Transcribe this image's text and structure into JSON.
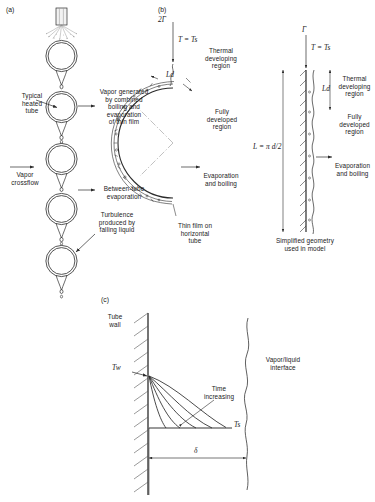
{
  "figure": {
    "type": "technical-diagram",
    "panels": [
      {
        "id": "(a)",
        "name": "tube-bundle-overview",
        "labels": [
          "Typical heated tube",
          "Vapor generated by combined boiling and evaporation of thin film",
          "Vapor crossflow",
          "Between-tube evaporation",
          "Turbulence produced by falling liquid"
        ]
      },
      {
        "id": "(b)",
        "name": "film-on-tube-and-simplified-geometry",
        "labels": [
          "Thermal developing region",
          "Fully developed region",
          "Evaporation and boiling",
          "Thin film on horizontal tube",
          "Simplified geometry used in model"
        ]
      },
      {
        "id": "(c)",
        "name": "temperature-profile-development",
        "labels": [
          "Tube wall",
          "Time increasing",
          "Vapor/liquid interface"
        ]
      }
    ]
  },
  "panel_a": {
    "id": "(a)",
    "typical_heated_tube": "Typical\nheated\ntube",
    "typical_heated_tube_lines": [
      "Typical",
      "heated",
      "tube"
    ],
    "vapor_generated_lines": [
      "Vapor generated",
      "by combined",
      "boiling and",
      "evaporation",
      "of thin film"
    ],
    "vapor_crossflow_lines": [
      "Vapor",
      "crossflow"
    ],
    "between_tube_lines": [
      "Between-tube",
      "evaporation"
    ],
    "turbulence_lines": [
      "Turbulence",
      "produced by",
      "falling liquid"
    ],
    "tube_count": 5
  },
  "panel_b": {
    "id": "(b)",
    "inlet_flow_symbol": "2Γ",
    "saturation_temp": "T = T",
    "saturation_temp_sub": "s",
    "thermal_developing_lines": [
      "Thermal",
      "developing",
      "region"
    ],
    "developing_length": "Ld",
    "developing_length_italic": "L",
    "developing_length_sub": "d",
    "fully_developed_lines": [
      "Fully",
      "developed",
      "region"
    ],
    "evaporation_boiling_lines": [
      "Evaporation",
      "and boiling"
    ],
    "thin_film_lines": [
      "Thin film on",
      "horizontal",
      "tube"
    ],
    "arc_length_label": "L = π d/2",
    "arc_length_L": "L",
    "arc_length_rest": " = π d/2",
    "right_inlet_flow_symbol": "Γ",
    "right_thermal_developing_lines": [
      "Thermal",
      "developing",
      "region"
    ],
    "right_fully_developed_lines": [
      "Fully",
      "developed",
      "region"
    ],
    "right_evaporation_boiling_lines": [
      "Evaporation",
      "and boiling"
    ],
    "simplified_geometry_lines": [
      "Simplified geometry",
      "used in model"
    ]
  },
  "panel_c": {
    "id": "(c)",
    "tube_wall_lines": [
      "Tube",
      "wall"
    ],
    "wall_temp": "T",
    "wall_temp_sub": "w",
    "time_increasing_lines": [
      "Time",
      "increasing"
    ],
    "interface_lines": [
      "Vapor/liquid",
      "interface"
    ],
    "sat_temp": "T",
    "sat_temp_sub": "s",
    "film_thickness_symbol": "δ",
    "curve_count": 5
  },
  "colors": {
    "line": "#2b2b2b",
    "text": "#1a1a1a",
    "background": "#ffffff",
    "hatch": "#555555",
    "film": "#3a3a3a"
  }
}
